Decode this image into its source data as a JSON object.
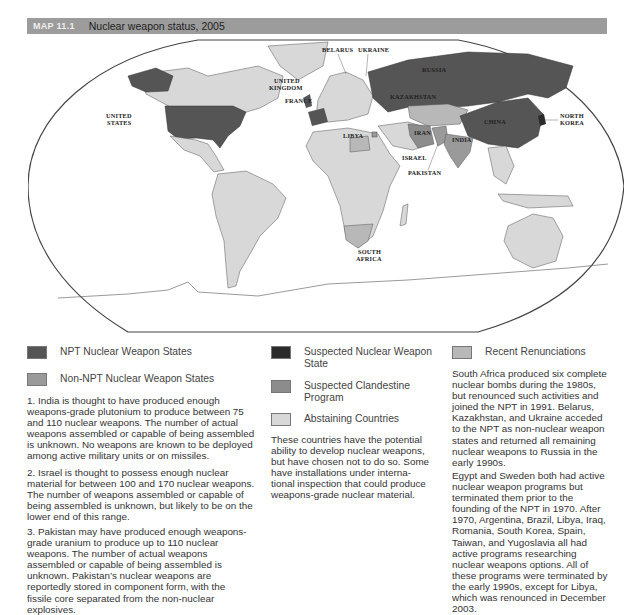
{
  "header": {
    "map_number": "MAP 11.1",
    "title": "Nuclear weapon status, 2005"
  },
  "colors": {
    "npt_nuclear": "#555555",
    "non_npt_nuclear": "#9a9a9a",
    "suspected_nuclear": "#2b2b2b",
    "suspected_clandestine": "#8c8c8c",
    "abstaining": "#d8d8d8",
    "recent_renunciation": "#b8b8b8",
    "header_bar": "#9c9c9c"
  },
  "map": {
    "labels": {
      "united_states": [
        "UNITED",
        "STATES"
      ],
      "united_kingdom": [
        "UNITED",
        "KINGDOM"
      ],
      "france": "FRANCE",
      "belarus": "BELARUS",
      "ukraine": "UKRAINE",
      "russia": "RUSSIA",
      "kazakhstan": "KAZAKHSTAN",
      "china": "CHINA",
      "north_korea": [
        "NORTH",
        "KOREA"
      ],
      "libya": "LIBYA",
      "iran": "IRAN",
      "india": "INDIA",
      "israel": "ISRAEL",
      "pakistan": "PAKISTAN",
      "south_africa": [
        "SOUTH",
        "AFRICA"
      ]
    }
  },
  "legend": {
    "npt": "NPT Nuclear Weapon States",
    "non_npt": "Non-NPT Nuclear Weapon States",
    "suspected_nuclear": [
      "Suspected Nuclear Weapon",
      "State"
    ],
    "suspected_clandestine": [
      "Suspected Clandestine",
      "Program"
    ],
    "abstaining": "Abstaining Countries",
    "recent": "Recent Renunciations"
  },
  "notes": {
    "india": [
      "1. India is thought to have produced enough",
      "weapons-grade plutonium to produce between 75",
      "and 110 nuclear weapons. The number of actual",
      "weapons assembled or capable of being assembled",
      "is unknown. No weapons are known to be deployed",
      "among active military units or on missiles."
    ],
    "israel": [
      "2. Israel is thought to possess enough nuclear",
      "material for between 100 and 170 nuclear weapons.",
      "The number of weapons assembled or capable of",
      "being assembled is unknown, but likely to be on the",
      "lower end of this range."
    ],
    "pakistan": [
      "3. Pakistan may have produced enough weapons-",
      "grade uranium to produce up to 110 nuclear",
      "weapons. The number of actual weapons",
      "assembled or capable of being assembled is",
      "unknown. Pakistan’s nuclear weapons are",
      "reportedly stored in component form, with the",
      "fissile core separated from the non-nuclear",
      "explosives."
    ],
    "abstaining": [
      "These countries have the potential",
      "ability to develop nuclear weapons,",
      "but have chosen not to do so. Some",
      "have installations under interna-",
      "tional inspection that could produce",
      "weapons-grade nuclear material."
    ],
    "south_africa": [
      "South Africa produced six complete",
      "nuclear bombs during the 1980s,",
      "but renounced such activities and",
      "joined the NPT in 1991. Belarus,",
      "Kazakhstan, and Ukraine acceded",
      "to the NPT as non-nuclear weapon",
      "states and returned all remaining",
      "nuclear weapons to Russia in the",
      "early 1990s."
    ],
    "egypt_sweden": [
      "Egypt and Sweden both had active",
      "nuclear weapon programs but",
      "terminated them prior to the",
      "founding of the NPT in 1970. After",
      "1970, Argentina, Brazil, Libya, Iraq,",
      "Romania, South Korea, Spain,",
      "Taiwan, and Yugoslavia all had",
      "active programs researching",
      "nuclear weapons options. All of",
      "these programs were terminated by",
      "the early 1990s, except for Libya,",
      "which was renounced in December",
      "2003."
    ]
  }
}
